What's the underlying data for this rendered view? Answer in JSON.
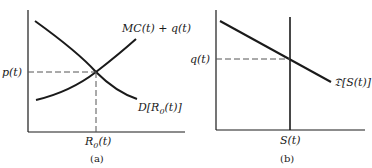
{
  "panels": [
    {
      "caption": "(a)",
      "y_label": "p(t)",
      "x_label": "R",
      "x_label_sub": "0",
      "x_label_tail": "(t)",
      "curve_supply_label": "MC(t) + q(t)",
      "curve_demand_label": "D[R",
      "curve_demand_sub": "0",
      "curve_demand_tail": "(t)]"
    },
    {
      "caption": "(b)",
      "y_label": "q(t)",
      "x_label": "S(t)",
      "curve_demand_label": "𝔇[S(t)]"
    }
  ],
  "colors": {
    "line": "#1a1a1a",
    "dashed": "#555555",
    "background": "#ffffff"
  }
}
